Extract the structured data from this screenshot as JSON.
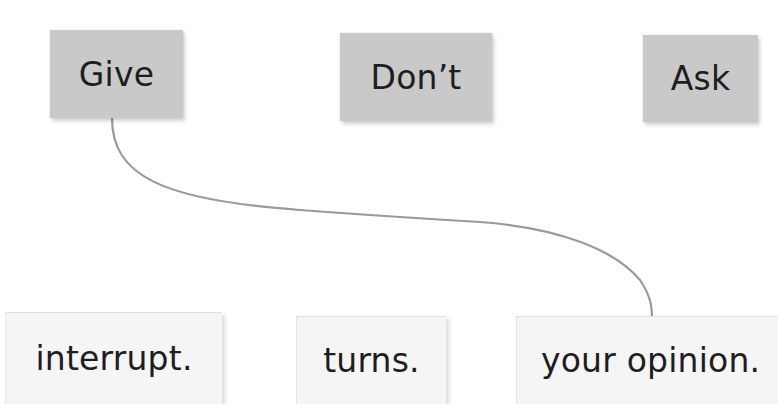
{
  "diagram": {
    "type": "matching-exercise",
    "top_row": [
      {
        "id": "give",
        "label": "Give"
      },
      {
        "id": "dont",
        "label": "Don’t"
      },
      {
        "id": "ask",
        "label": "Ask"
      }
    ],
    "bottom_row": [
      {
        "id": "interrupt",
        "label": "interrupt."
      },
      {
        "id": "turns",
        "label": "turns."
      },
      {
        "id": "opinion",
        "label": "your opinion."
      }
    ],
    "connections": [
      {
        "from": "give",
        "to": "opinion"
      }
    ],
    "colors": {
      "top_box": "#c9c9c9",
      "bottom_box": "#f5f5f5",
      "line": "#9a9a9a",
      "text": "#1e1e1e"
    }
  }
}
